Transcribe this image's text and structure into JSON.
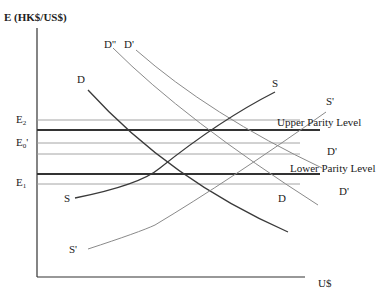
{
  "diagram": {
    "y_axis_label": "E (HK$/US$)",
    "x_axis_label": "U$",
    "levels": {
      "E2": {
        "base": "E",
        "sub": "2",
        "y": 120
      },
      "E0p": {
        "base": "E",
        "sub": "0",
        "suffix": "'",
        "y": 143
      },
      "E1": {
        "base": "E",
        "sub": "1",
        "y": 184
      }
    },
    "parity": {
      "upper": {
        "label": "Upper Parity Level",
        "y": 130
      },
      "lower": {
        "label": "Lower Parity Level",
        "y": 174
      }
    },
    "curves": {
      "D": {
        "label": "D"
      },
      "D_pp": {
        "label": "D''"
      },
      "D_p": {
        "label": "D'"
      },
      "D_p_mid": {
        "label": "D'"
      },
      "D_p_low": {
        "label": "D'"
      },
      "S": {
        "label": "S"
      },
      "S_low": {
        "label": "S"
      },
      "S_p": {
        "label": "S'"
      },
      "S_p_low": {
        "label": "S'"
      }
    },
    "colors": {
      "axis": "#333333",
      "thick_line": "#333333",
      "thin_line": "#9a9a9a",
      "curve_dark": "#3a3a3a",
      "curve_light": "#8a8a8a"
    }
  }
}
